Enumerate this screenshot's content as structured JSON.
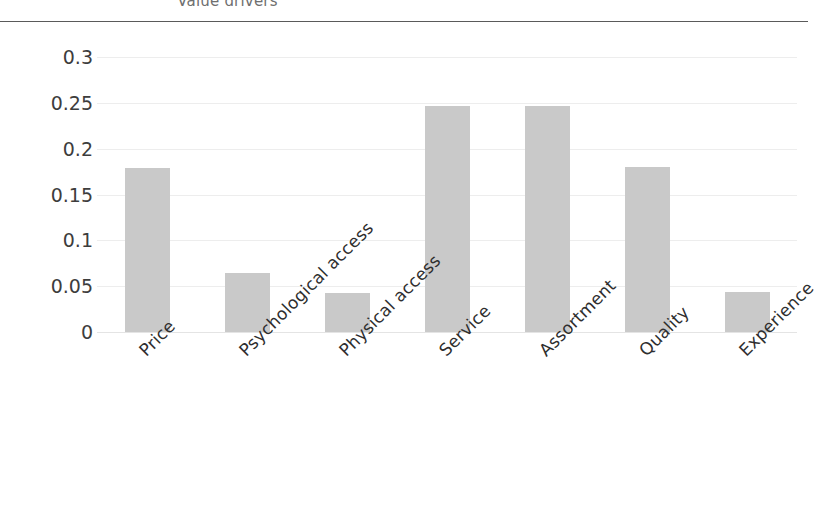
{
  "chart_data": {
    "type": "bar",
    "title": "Value drivers",
    "xlabel": "",
    "ylabel": "",
    "categories": [
      "Price",
      "Psychological access",
      "Physical access",
      "Service",
      "Assortment",
      "Quality",
      "Experience"
    ],
    "values": [
      0.179,
      0.064,
      0.043,
      0.247,
      0.247,
      0.18,
      0.044
    ],
    "ylim": [
      0,
      0.3
    ],
    "yticks": [
      0,
      0.05,
      0.1,
      0.15,
      0.2,
      0.25,
      0.3
    ],
    "ytick_labels": [
      "0",
      "0.05",
      "0.1",
      "0.15",
      "0.2",
      "0.25",
      "0.3"
    ],
    "grid": true,
    "legend": false,
    "bar_color": "#c9c9c9",
    "gridline_color": "#ededed",
    "title_color": "#6f6f6f",
    "rule_color": "#5a5a5a",
    "label_rotation": -45
  }
}
